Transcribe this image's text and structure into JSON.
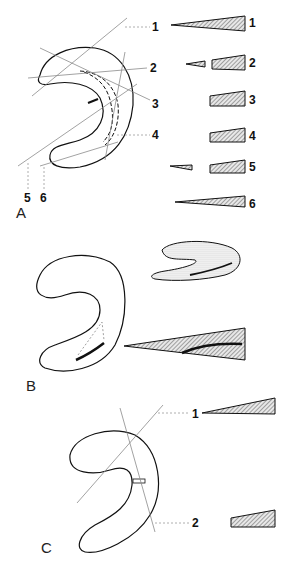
{
  "panels": {
    "A": {
      "label": "A",
      "line_labels": [
        "1",
        "2",
        "3",
        "4",
        "5",
        "6"
      ],
      "section_labels": [
        "1",
        "2",
        "3",
        "4",
        "5",
        "6"
      ]
    },
    "B": {
      "label": "B"
    },
    "C": {
      "label": "C",
      "line_labels": [
        "1",
        "2"
      ]
    }
  },
  "colors": {
    "ink": "#111111",
    "guide": "#8a8a8a",
    "hatch": "#555555"
  }
}
